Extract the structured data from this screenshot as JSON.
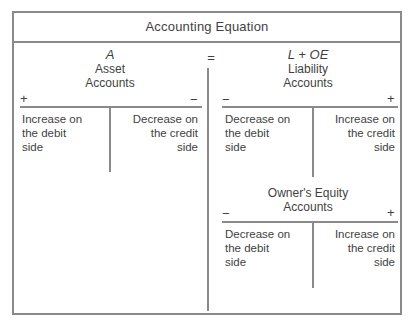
{
  "title": "Accounting Equation",
  "equals_sign": "=",
  "colors": {
    "line": "#8a8a8a",
    "text": "#3f3f3f",
    "background": "#ffffff"
  },
  "asset_account": {
    "symbol": "A",
    "name_line1": "Asset",
    "name_line2": "Accounts",
    "left_sign": "+",
    "right_sign": "−",
    "left_cell": "Increase on\nthe debit\nside",
    "right_cell": "Decrease on\nthe credit\nside"
  },
  "liability_account": {
    "symbol": "L + OE",
    "name_line1": "Liability",
    "name_line2": "Accounts",
    "left_sign": "−",
    "right_sign": "+",
    "left_cell": "Decrease on\nthe debit\nside",
    "right_cell": "Increase on\nthe credit\nside"
  },
  "equity_account": {
    "name_line1": "Owner's Equity",
    "name_line2": "Accounts",
    "left_sign": "−",
    "right_sign": "+",
    "left_cell": "Decrease on\nthe debit\nside",
    "right_cell": "Increase on\nthe credit\nside"
  }
}
